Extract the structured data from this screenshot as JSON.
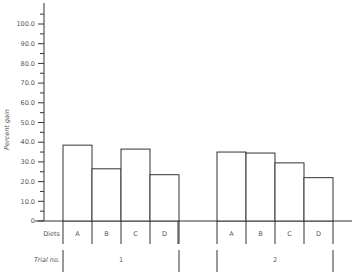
{
  "chart_data": {
    "type": "bar",
    "title": "",
    "xlabel": "",
    "ylabel": "Percent gain",
    "ylim": [
      0,
      100
    ],
    "yticks": [
      "0",
      "10.0",
      "20.0",
      "30.0",
      "40.0",
      "50.0",
      "60.0",
      "70.0",
      "80.0",
      "90.0",
      "100.0"
    ],
    "grid": false,
    "row_labels": {
      "diets": "Diets",
      "trial": "Trial no."
    },
    "groups": [
      {
        "trial": "1",
        "categories": [
          "A",
          "B",
          "C",
          "D"
        ],
        "values": [
          38.5,
          26.5,
          36.5,
          23.5
        ]
      },
      {
        "trial": "2",
        "categories": [
          "A",
          "B",
          "C",
          "D"
        ],
        "values": [
          35.0,
          34.5,
          29.5,
          22.0
        ]
      }
    ]
  },
  "colors": {
    "axis": "#333333",
    "bar_fill": "#ffffff",
    "bar_stroke": "#333333",
    "text": "#555555"
  }
}
